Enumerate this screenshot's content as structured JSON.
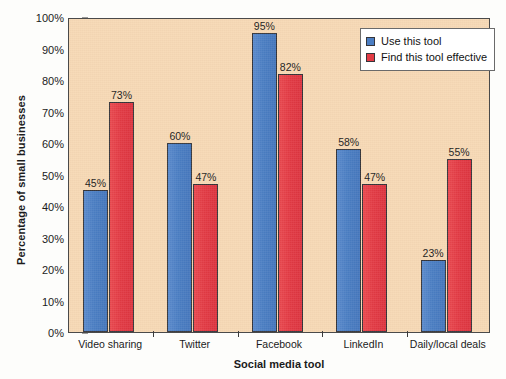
{
  "chart_data": {
    "type": "bar",
    "title": "",
    "xlabel": "Social media tool",
    "ylabel": "Percentage of small businesses",
    "categories": [
      "Video sharing",
      "Twitter",
      "Facebook",
      "LinkedIn",
      "Daily/local deals"
    ],
    "series": [
      {
        "name": "Use this tool",
        "color": "#4b7ec3",
        "values": [
          45,
          60,
          95,
          58,
          23
        ],
        "value_labels": [
          "45%",
          "60%",
          "95%",
          "58%",
          "23%"
        ]
      },
      {
        "name": "Find this tool effective",
        "color": "#e33b45",
        "values": [
          73,
          47,
          82,
          47,
          55
        ],
        "value_labels": [
          "73%",
          "47%",
          "82%",
          "47%",
          "55%"
        ]
      }
    ],
    "ylim": [
      0,
      100
    ],
    "ytick_values": [
      0,
      10,
      20,
      30,
      40,
      50,
      60,
      70,
      80,
      90,
      100
    ],
    "ytick_labels": [
      "0%",
      "10%",
      "20%",
      "30%",
      "40%",
      "50%",
      "60%",
      "70%",
      "80%",
      "90%",
      "100%"
    ],
    "grid": false,
    "legend_position": "top-right",
    "plot_background_color": "#f7d9b5",
    "figure_background_color": "#fdfdfb",
    "axis_color": "#3a3a3a"
  },
  "legend": {
    "items": [
      {
        "label": "Use this tool",
        "color": "#4b7ec3"
      },
      {
        "label": "Find this tool effective",
        "color": "#e33b45"
      }
    ]
  }
}
